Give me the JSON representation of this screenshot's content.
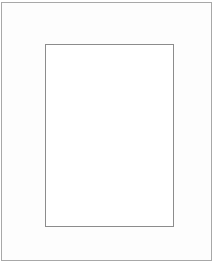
{
  "frame": {
    "outer_border_color": "#a8a8a8",
    "inner_border_color": "#8c8c8c",
    "background_color": "#ffffff"
  }
}
